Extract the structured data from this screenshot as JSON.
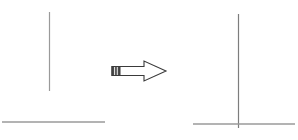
{
  "diagram": {
    "type": "line-drawing-transformation",
    "background_color": "#ffffff",
    "stroke_color": "#9a9a9a",
    "arrow_color": "#3a3a3a",
    "left_panel": {
      "name": "before-state",
      "vertical_line": {
        "x": 49.5,
        "y1": 12,
        "y2": 91,
        "stroke_width": 1.2,
        "color": "#9a9a9a"
      },
      "horizontal_line": {
        "x1": 2,
        "x2": 105,
        "y": 122,
        "stroke_width": 1.4,
        "color": "#9a9a9a"
      },
      "gap_px": 31,
      "joined": false
    },
    "arrow": {
      "name": "transformation-arrow",
      "direction": "right",
      "x_start": 112,
      "x_end": 166,
      "center_y": 71,
      "shaft_height": 9,
      "head_width": 22,
      "head_height": 20,
      "tail_stripes": 3,
      "outline_color": "#3a3a3a",
      "fill_color": "#ffffff",
      "tail_fill_color": "#4a4a4a"
    },
    "right_panel": {
      "name": "after-state",
      "vertical_line": {
        "x": 238.5,
        "y1": 14,
        "y2": 128,
        "stroke_width": 1.2,
        "color": "#7d7d7d"
      },
      "horizontal_line": {
        "x1": 193,
        "x2": 295,
        "y": 124,
        "stroke_width": 1.4,
        "color": "#9a9a9a"
      },
      "gap_px": 0,
      "joined": true
    }
  }
}
